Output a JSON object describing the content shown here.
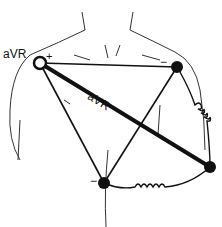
{
  "diagram": {
    "labels": {
      "electrode_label": "aVR",
      "lead_axis_label": "aVR",
      "positive_sign": "+",
      "negative_sign_left_arm": "−",
      "negative_sign_leg": "−"
    },
    "electrodes": [
      {
        "name": "right-arm",
        "type": "open",
        "polarity": "+",
        "x": 40,
        "y": 63
      },
      {
        "name": "left-arm",
        "type": "filled",
        "polarity": "−",
        "x": 177,
        "y": 67
      },
      {
        "name": "left-leg",
        "type": "filled",
        "x": 210,
        "y": 167
      },
      {
        "name": "lower-torso",
        "type": "filled",
        "polarity": "−",
        "x": 104,
        "y": 183
      }
    ],
    "colors": {
      "line": "#111111",
      "sketch": "#333333",
      "background": "#ffffff"
    }
  }
}
